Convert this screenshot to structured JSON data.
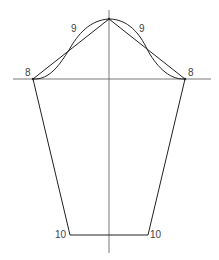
{
  "diagram": {
    "type": "sleeve-pattern-draft",
    "colors": {
      "background": "#ffffff",
      "outline": "#222222",
      "guide": "#555555",
      "label": "#444444"
    },
    "points": {
      "apex": {
        "x": 109,
        "y": 19
      },
      "left_cap": {
        "x": 33,
        "y": 79
      },
      "right_cap": {
        "x": 185,
        "y": 79
      },
      "left_hem": {
        "x": 70,
        "y": 235
      },
      "right_hem": {
        "x": 148,
        "y": 235
      },
      "left_mid": {
        "x": 69,
        "y": 50
      },
      "right_mid": {
        "x": 147,
        "y": 49
      }
    },
    "guides": {
      "horizontal": {
        "x1": 13,
        "x2": 211,
        "y": 79
      },
      "vertical": {
        "x": 109,
        "y1": 10,
        "y2": 253
      }
    },
    "labels": {
      "left_cap": "8",
      "right_cap": "8",
      "left_curve": "9",
      "right_curve": "9",
      "left_hem": "10",
      "right_hem": "10"
    }
  }
}
